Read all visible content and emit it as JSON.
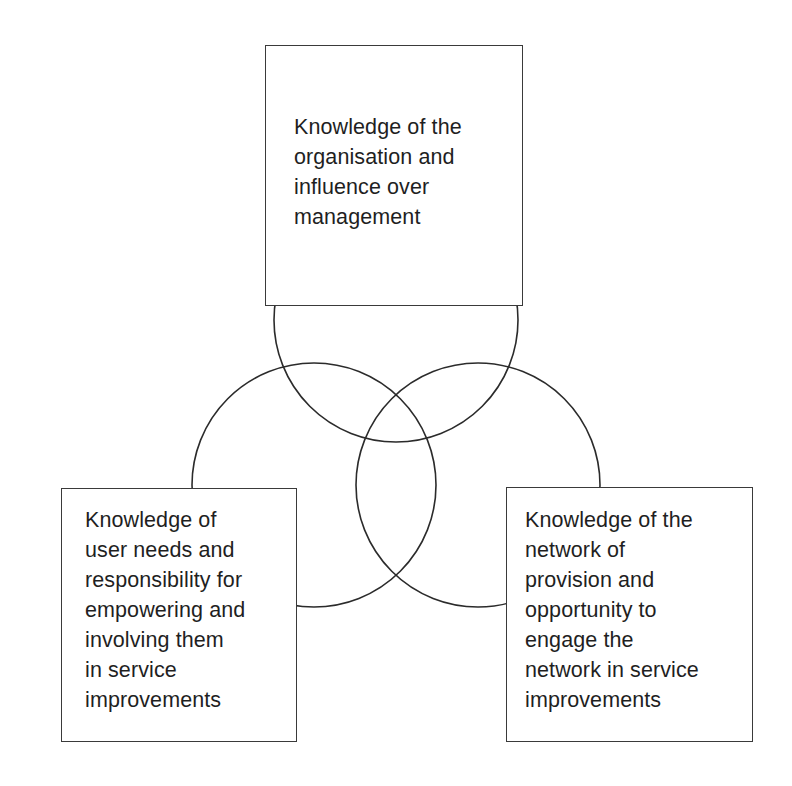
{
  "figure": {
    "type": "venn-three-circle",
    "background_color": "#ffffff",
    "line_color": "#2b2b2b",
    "text_color": "#1f1f1f"
  },
  "nodes": {
    "top": {
      "id": "knowledge-of-organisation",
      "text": "Knowledge of the\norganisation and\ninfluence over\nmanagement",
      "lines": [
        "Knowledge of the",
        "organisation and",
        "influence over",
        "management"
      ]
    },
    "left": {
      "id": "knowledge-of-user-needs",
      "text": "Knowledge of\nuser needs and\nresponsibility for\nempowering and\ninvolving them\nin service\nimprovements",
      "lines": [
        "Knowledge of",
        "user needs and",
        "responsibility for",
        "empowering and",
        "involving them",
        "in service",
        "improvements"
      ]
    },
    "right": {
      "id": "knowledge-of-network",
      "text": "Knowledge of the\nnetwork of\nprovision and\nopportunity to\nengage the\nnetwork in service\nimprovements",
      "lines": [
        "Knowledge of the",
        "network of",
        "provision and",
        "opportunity to",
        "engage the",
        "network in service",
        "improvements"
      ]
    }
  },
  "circles": [
    {
      "name": "top-circle",
      "cx": 396,
      "cy": 320,
      "r": 122
    },
    {
      "name": "left-circle",
      "cx": 314,
      "cy": 485,
      "r": 122
    },
    {
      "name": "right-circle",
      "cx": 478,
      "cy": 485,
      "r": 122
    }
  ],
  "caption": {
    "text": "",
    "note": "cropped"
  }
}
